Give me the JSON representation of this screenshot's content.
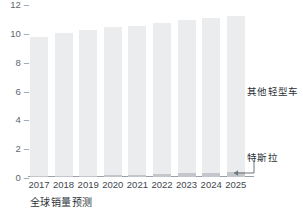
{
  "chart_data": {
    "type": "bar",
    "stacked": true,
    "title": "",
    "subtitle": "",
    "xlabel": "全球销量预测",
    "ylabel": "",
    "ylim": [
      0,
      12
    ],
    "yticks": [
      0,
      2,
      4,
      6,
      8,
      10,
      12
    ],
    "grid": false,
    "legend_position": "right-inline",
    "categories": [
      "2017",
      "2018",
      "2019",
      "2020",
      "2021",
      "2022",
      "2023",
      "2024",
      "2025"
    ],
    "series": [
      {
        "name": "特斯拉",
        "color": "#c3c7cb",
        "values": [
          0.1,
          0.1,
          0.1,
          0.12,
          0.15,
          0.2,
          0.25,
          0.3,
          0.35
        ]
      },
      {
        "name": "其他轻型车",
        "color": "#ebecee",
        "values": [
          9.6,
          9.9,
          10.1,
          10.28,
          10.35,
          10.5,
          10.65,
          10.7,
          10.85
        ]
      }
    ],
    "totals": [
      9.7,
      10.0,
      10.2,
      10.4,
      10.5,
      10.7,
      10.9,
      11.0,
      11.2
    ],
    "annotations": [
      {
        "text": "其他轻型车",
        "target": "upper-segment"
      },
      {
        "text": "特斯拉",
        "target": "lower-segment"
      }
    ]
  },
  "axis": {
    "y_tick_dash": "–"
  }
}
